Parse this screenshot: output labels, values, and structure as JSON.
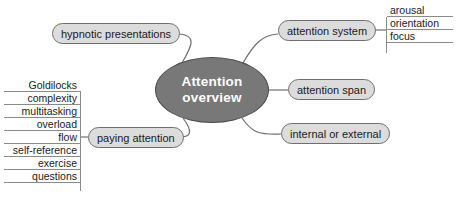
{
  "diagram": {
    "type": "mind-map",
    "title": "Attention overview",
    "background_color": "#ffffff",
    "center": {
      "label_line1": "Attention",
      "label_line2": "overview",
      "fill_color": "#787878",
      "text_color": "#ffffff",
      "border_color": "#4c4c4c"
    },
    "branch_style": {
      "fill_color": "#dcdcdc",
      "border_color": "#6e6e6e",
      "text_color": "#1a1a1a",
      "connector_color": "#6e6e6e"
    },
    "branches": [
      {
        "id": "hypnotic-presentations",
        "label": "hypnotic presentations",
        "side": "left"
      },
      {
        "id": "paying-attention",
        "label": "paying attention",
        "side": "left"
      },
      {
        "id": "attention-system",
        "label": "attention system",
        "side": "right"
      },
      {
        "id": "attention-span",
        "label": "attention span",
        "side": "right"
      },
      {
        "id": "internal-or-external",
        "label": "internal or external",
        "side": "right"
      }
    ],
    "leaf_lists": [
      {
        "id": "paying-attention-leaves",
        "parent": "paying-attention",
        "align": "right",
        "items": [
          "Goldilocks",
          "complexity",
          "multitasking",
          "overload",
          "flow",
          "self-reference",
          "exercise",
          "questions"
        ]
      },
      {
        "id": "attention-system-leaves",
        "parent": "attention-system",
        "align": "left",
        "items": [
          "arousal",
          "orientation",
          "focus"
        ]
      }
    ]
  }
}
